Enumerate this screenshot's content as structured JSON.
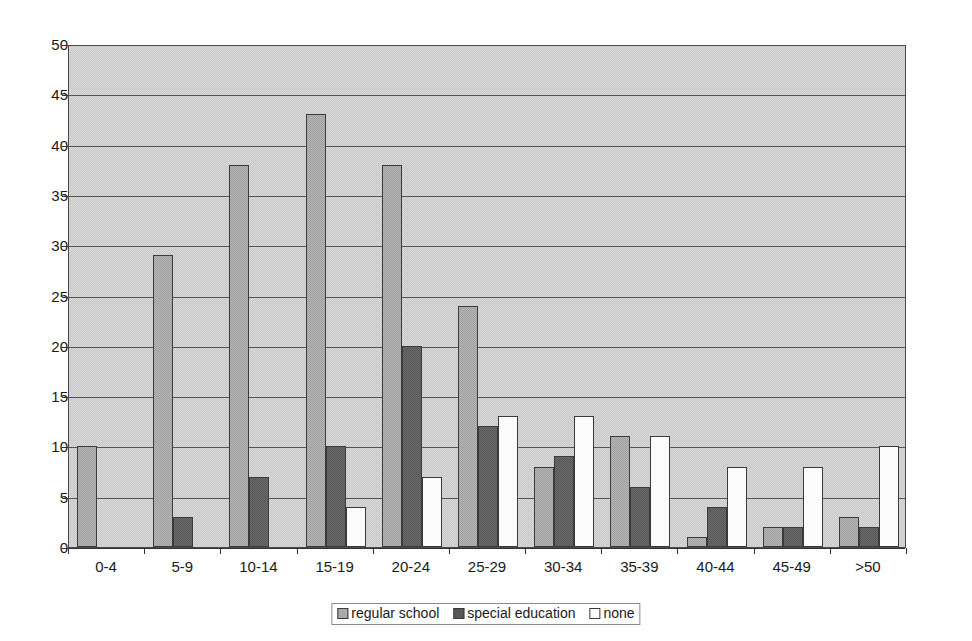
{
  "chart_data": {
    "type": "bar",
    "title": "",
    "subtitle": "",
    "xlabel": "",
    "ylabel": "",
    "ylim": [
      0,
      50
    ],
    "ytick_step": 5,
    "yticks": [
      50,
      45,
      40,
      35,
      30,
      25,
      20,
      15,
      10,
      5,
      0
    ],
    "grid": true,
    "legend_position": "bottom-center",
    "categories": [
      "0-4",
      "5-9",
      "10-14",
      "15-19",
      "20-24",
      "25-29",
      "30-34",
      "35-39",
      "40-44",
      "45-49",
      ">50"
    ],
    "series": [
      {
        "name": "regular school",
        "color": "#a0a0a0",
        "values": [
          10,
          29,
          38,
          43,
          38,
          24,
          8,
          11,
          1,
          2,
          3
        ]
      },
      {
        "name": "special education",
        "color": "#575757",
        "values": [
          0,
          3,
          7,
          10,
          20,
          12,
          9,
          6,
          4,
          2,
          2
        ]
      },
      {
        "name": "none",
        "color": "#ffffff",
        "values": [
          0,
          0,
          0,
          4,
          7,
          13,
          13,
          11,
          8,
          8,
          10
        ]
      }
    ],
    "colors": {
      "plot_background": "#c8c8c8",
      "gridline": "#555555",
      "axis": "#333333",
      "bar_border": "#3b3b3b",
      "text": "#1a1a1a",
      "page_background": "#ffffff"
    }
  }
}
